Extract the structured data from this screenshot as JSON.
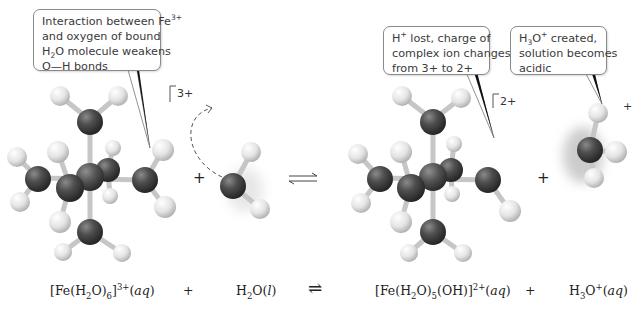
{
  "callouts": {
    "left": {
      "lines": [
        "Interaction between Fe",
        "and oxygen of bound",
        "H",
        "O molecule weakens",
        "O—H bonds"
      ],
      "fe_charge": "3+",
      "h2o_sub": "2"
    },
    "middle": {
      "h": "H",
      "h_sup": "+",
      "line1_rest": " lost, charge of",
      "line2": "complex ion changes",
      "line3": "from 3+ to 2+"
    },
    "right": {
      "h": "H",
      "sub": "3",
      "o": "O",
      "sup": "+",
      "line1_rest": " created,",
      "line2": "solution becomes",
      "line3": "acidic"
    }
  },
  "molecule_labels": {
    "left_complex_charge": "3+",
    "right_complex_charge": "2+",
    "hydronium_charge": "+",
    "plus_left": "+",
    "plus_right": "+"
  },
  "equation": {
    "term1": {
      "a": "[Fe(H",
      "s1": "2",
      "b": "O)",
      "s2": "6",
      "c": "]",
      "sup": "3+",
      "state": "aq"
    },
    "plus1": "+",
    "term2": {
      "a": "H",
      "s1": "2",
      "b": "O(",
      "state": "l",
      "c": ")"
    },
    "arrow": "⇌",
    "term3": {
      "a": "[Fe(H",
      "s1": "2",
      "b": "O)",
      "s2": "5",
      "c": "(OH)]",
      "sup": "2+",
      "state": "aq"
    },
    "plus2": "+",
    "term4": {
      "a": "H",
      "s1": "3",
      "b": "O",
      "sup": "+",
      "state": "aq"
    }
  },
  "colors": {
    "oxygen": "#4a4a4a",
    "iron": "#555555",
    "hydrogen": "#e8e8e8",
    "bond": "#c8c8c8",
    "callout_border": "#8a8a8a"
  }
}
